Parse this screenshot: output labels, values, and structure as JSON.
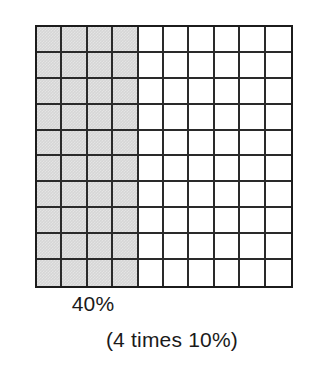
{
  "figure": {
    "name": "percent-area-model",
    "grid": {
      "columns": 10,
      "rows": 10,
      "total_cells": 100,
      "shaded_columns": 4,
      "shaded_cells": 40,
      "shade_color": "#d6d6d6",
      "line_color": "#2a2a2a",
      "border_color": "#1c1c1c",
      "background_color": "#ffffff"
    },
    "captions": {
      "primary": "40%",
      "secondary": "(4 times 10%)"
    }
  },
  "chart_data": {
    "type": "heatmap",
    "title": "40%",
    "subtitle": "(4 times 10%)",
    "xlabel": "",
    "ylabel": "",
    "categories": [
      "1",
      "2",
      "3",
      "4",
      "5",
      "6",
      "7",
      "8",
      "9",
      "10"
    ],
    "rows": [
      "1",
      "2",
      "3",
      "4",
      "5",
      "6",
      "7",
      "8",
      "9",
      "10"
    ],
    "values": [
      [
        1,
        1,
        1,
        1,
        0,
        0,
        0,
        0,
        0,
        0
      ],
      [
        1,
        1,
        1,
        1,
        0,
        0,
        0,
        0,
        0,
        0
      ],
      [
        1,
        1,
        1,
        1,
        0,
        0,
        0,
        0,
        0,
        0
      ],
      [
        1,
        1,
        1,
        1,
        0,
        0,
        0,
        0,
        0,
        0
      ],
      [
        1,
        1,
        1,
        1,
        0,
        0,
        0,
        0,
        0,
        0
      ],
      [
        1,
        1,
        1,
        1,
        0,
        0,
        0,
        0,
        0,
        0
      ],
      [
        1,
        1,
        1,
        1,
        0,
        0,
        0,
        0,
        0,
        0
      ],
      [
        1,
        1,
        1,
        1,
        0,
        0,
        0,
        0,
        0,
        0
      ],
      [
        1,
        1,
        1,
        1,
        0,
        0,
        0,
        0,
        0,
        0
      ],
      [
        1,
        1,
        1,
        1,
        0,
        0,
        0,
        0,
        0,
        0
      ]
    ],
    "legend": [
      {
        "label": "shaded",
        "value": 1,
        "color": "#d6d6d6",
        "count": 40
      },
      {
        "label": "unshaded",
        "value": 0,
        "color": "#ffffff",
        "count": 60
      }
    ],
    "annotations": [
      "40%",
      "(4 times 10%)"
    ],
    "grid": true,
    "legend_position": "none"
  }
}
